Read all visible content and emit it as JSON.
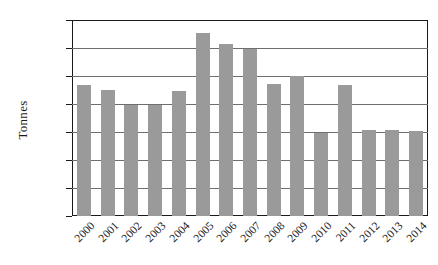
{
  "chart_data": {
    "type": "bar",
    "title": "",
    "xlabel": "",
    "ylabel": "Tonnes",
    "categories": [
      "2000",
      "2001",
      "2002",
      "2003",
      "2004",
      "2005",
      "2006",
      "2007",
      "2008",
      "2009",
      "2010",
      "2011",
      "2012",
      "2013",
      "2014"
    ],
    "values": [
      46800,
      45000,
      39500,
      39800,
      44800,
      65400,
      61500,
      59500,
      47300,
      50000,
      29800,
      46700,
      30600,
      30700,
      30200
    ],
    "ylim": [
      0,
      70000
    ],
    "ytick_labels": [
      "70,000",
      "60,000",
      "50,000",
      "40,000",
      "30,000",
      "20,000",
      "10,000",
      "0"
    ],
    "ytick_values": [
      70000,
      60000,
      50000,
      40000,
      30000,
      20000,
      10000,
      0
    ],
    "grid": true,
    "legend": "none",
    "bar_color": "#9a9a9a",
    "axis_color": "#1a1a1a",
    "grid_color": "#6e6e6e",
    "background": "#ffffff"
  }
}
